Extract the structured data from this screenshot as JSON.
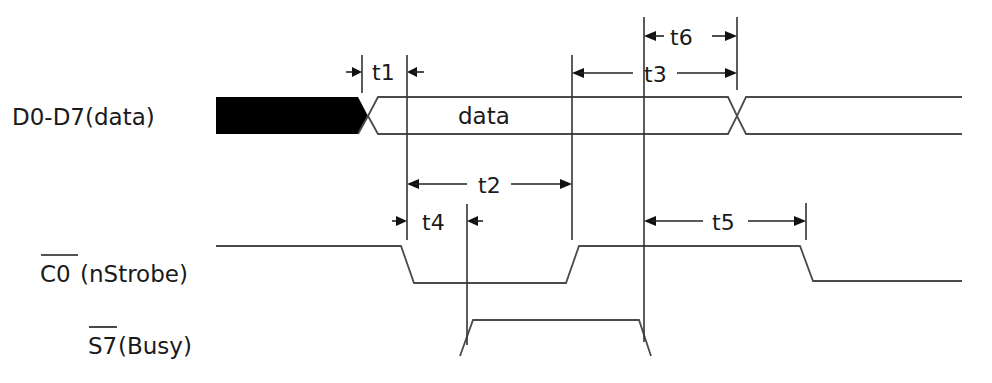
{
  "diagram": {
    "type": "timing-diagram",
    "signals": [
      {
        "id": "data",
        "label": "D0-D7(data)",
        "overbar": "",
        "rest": "D0-D7(data)",
        "inner_label": "data"
      },
      {
        "id": "nstrobe",
        "label": "C0(nStrobe)",
        "overbar": "C0",
        "rest": "(nStrobe)"
      },
      {
        "id": "busy",
        "label": "S7(Busy)",
        "overbar": "S7",
        "rest": "(Busy)"
      }
    ],
    "timings": [
      {
        "id": "t1",
        "label": "t1",
        "from_event": "data valid",
        "to_event": "nStrobe falling edge (setup)"
      },
      {
        "id": "t2",
        "label": "t2",
        "from_event": "nStrobe falling edge",
        "to_event": "nStrobe rising edge (strobe width)"
      },
      {
        "id": "t3",
        "label": "t3",
        "from_event": "nStrobe rising edge",
        "to_event": "data change (hold)"
      },
      {
        "id": "t4",
        "label": "t4",
        "from_event": "nStrobe falling edge",
        "to_event": "Busy rising edge"
      },
      {
        "id": "t5",
        "label": "t5",
        "from_event": "Busy falling edge",
        "to_event": "next nStrobe falling edge"
      },
      {
        "id": "t6",
        "label": "t6",
        "from_event": "Busy falling edge",
        "to_event": "data change"
      }
    ],
    "colors": {
      "line": "#4a4a4a",
      "text": "#1a1a1a",
      "fill_invalid": "#000000",
      "background": "#ffffff"
    }
  }
}
